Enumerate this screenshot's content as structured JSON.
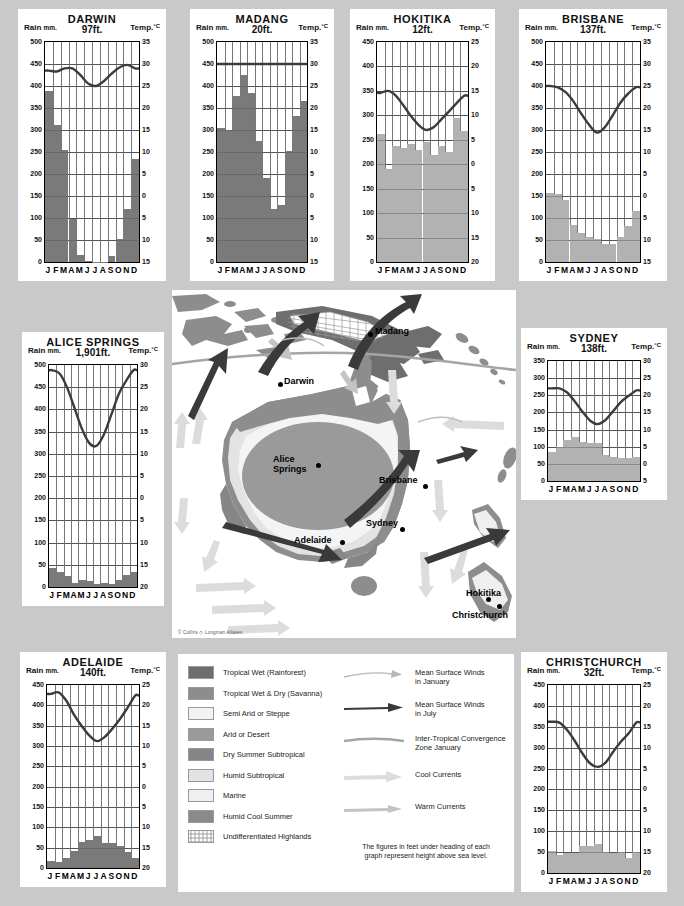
{
  "page": {
    "background_color": "#c9c9c9",
    "copyright": "© Collins ◇ Longman Atlases"
  },
  "labels": {
    "rain_axis": "Rain",
    "rain_unit": "mm.",
    "temp_axis": "Temp.",
    "temp_unit": "°C",
    "months": [
      "J",
      "F",
      "M",
      "A",
      "M",
      "J",
      "J",
      "A",
      "S",
      "O",
      "N",
      "D"
    ]
  },
  "colors": {
    "bar_dark": "#7a7a7a",
    "bar_light": "#b2b2b2",
    "temp_line": "#3c3c3c",
    "panel": "#ffffff",
    "grid": "#555555"
  },
  "chart_data": [
    {
      "type": "bar",
      "id": "darwin",
      "title": "DARWIN",
      "subtitle": "97ft.",
      "xlabel": "",
      "ylabel": "Rain mm.",
      "y2label": "Temp.°C",
      "categories": [
        "J",
        "F",
        "M",
        "A",
        "M",
        "J",
        "J",
        "A",
        "S",
        "O",
        "N",
        "D"
      ],
      "rain_ticks": [
        0,
        50,
        100,
        150,
        200,
        250,
        300,
        350,
        400,
        450,
        500
      ],
      "temp_ticks": [
        -15,
        -10,
        -5,
        0,
        5,
        10,
        15,
        20,
        25,
        30,
        35
      ],
      "ylim": [
        0,
        500
      ],
      "y2lim": [
        -15,
        35
      ],
      "bar_color": "#7a7a7a",
      "series": [
        {
          "name": "Rainfall (mm)",
          "type": "bar",
          "values": [
            388,
            312,
            255,
            97,
            17,
            3,
            1,
            1,
            13,
            53,
            120,
            235
          ]
        },
        {
          "name": "Temperature (°C)",
          "type": "line",
          "values": [
            28.5,
            28.3,
            29.0,
            29.0,
            27.5,
            25.6,
            25.0,
            26.1,
            27.8,
            29.2,
            29.8,
            29.0
          ]
        }
      ]
    },
    {
      "type": "bar",
      "id": "madang",
      "title": "MADANG",
      "subtitle": "20ft.",
      "xlabel": "",
      "ylabel": "Rain mm.",
      "y2label": "Temp.°C",
      "categories": [
        "J",
        "F",
        "M",
        "A",
        "M",
        "J",
        "J",
        "A",
        "S",
        "O",
        "N",
        "D"
      ],
      "rain_ticks": [
        0,
        50,
        100,
        150,
        200,
        250,
        300,
        350,
        400,
        450,
        500
      ],
      "temp_ticks": [
        -15,
        -10,
        -5,
        0,
        5,
        10,
        15,
        20,
        25,
        30,
        35
      ],
      "ylim": [
        0,
        500
      ],
      "y2lim": [
        -15,
        35
      ],
      "bar_color": "#7a7a7a",
      "series": [
        {
          "name": "Rainfall (mm)",
          "type": "bar",
          "values": [
            305,
            300,
            378,
            425,
            385,
            275,
            192,
            120,
            130,
            253,
            332,
            367
          ]
        },
        {
          "name": "Temperature (°C)",
          "type": "line",
          "values": [
            30,
            30,
            30,
            30,
            30,
            30,
            30,
            30,
            30,
            30,
            30,
            30
          ]
        }
      ]
    },
    {
      "type": "bar",
      "id": "hokitika",
      "title": "HOKITIKA",
      "subtitle": "12ft.",
      "xlabel": "",
      "ylabel": "Rain mm.",
      "y2label": "Temp.°C",
      "categories": [
        "J",
        "F",
        "M",
        "A",
        "M",
        "J",
        "J",
        "A",
        "S",
        "O",
        "N",
        "D"
      ],
      "rain_ticks": [
        0,
        50,
        100,
        150,
        200,
        250,
        300,
        350,
        400,
        450
      ],
      "temp_ticks": [
        -20,
        -15,
        -10,
        -5,
        0,
        5,
        10,
        15,
        20,
        25
      ],
      "ylim": [
        0,
        450
      ],
      "y2lim": [
        -20,
        25
      ],
      "bar_color": "#b2b2b2",
      "series": [
        {
          "name": "Rainfall (mm)",
          "type": "bar",
          "values": [
            261,
            190,
            238,
            234,
            241,
            229,
            246,
            218,
            238,
            225,
            295,
            268
          ]
        },
        {
          "name": "Temperature (°C)",
          "type": "line",
          "values": [
            14.6,
            15.0,
            14.0,
            12.0,
            9.8,
            8.0,
            7.0,
            7.6,
            9.2,
            10.8,
            12.5,
            14.0
          ]
        }
      ]
    },
    {
      "type": "bar",
      "id": "brisbane",
      "title": "BRISBANE",
      "subtitle": "137ft.",
      "xlabel": "",
      "ylabel": "Rain mm.",
      "y2label": "Temp.°C",
      "categories": [
        "J",
        "F",
        "M",
        "A",
        "M",
        "J",
        "J",
        "A",
        "S",
        "O",
        "N",
        "D"
      ],
      "rain_ticks": [
        0,
        50,
        100,
        150,
        200,
        250,
        300,
        350,
        400,
        450,
        500
      ],
      "temp_ticks": [
        -15,
        -10,
        -5,
        0,
        5,
        10,
        15,
        20,
        25,
        30,
        35
      ],
      "ylim": [
        0,
        500
      ],
      "y2lim": [
        -15,
        35
      ],
      "bar_color": "#b2b2b2",
      "series": [
        {
          "name": "Rainfall (mm)",
          "type": "bar",
          "values": [
            158,
            155,
            140,
            85,
            65,
            58,
            53,
            40,
            42,
            58,
            83,
            115
          ]
        },
        {
          "name": "Temperature (°C)",
          "type": "line",
          "values": [
            25.0,
            24.7,
            23.6,
            21.5,
            18.7,
            16.2,
            14.4,
            15.6,
            18.3,
            21.2,
            23.3,
            24.7
          ]
        }
      ]
    },
    {
      "type": "bar",
      "id": "alice-springs",
      "title": "ALICE SPRINGS",
      "subtitle": "1,901ft.",
      "xlabel": "",
      "ylabel": "Rain mm.",
      "y2label": "Temp.°C",
      "categories": [
        "J",
        "F",
        "M",
        "A",
        "M",
        "J",
        "J",
        "A",
        "S",
        "O",
        "N",
        "D"
      ],
      "rain_ticks": [
        0,
        50,
        100,
        150,
        200,
        250,
        300,
        350,
        400,
        450,
        500
      ],
      "temp_ticks": [
        -20,
        -15,
        -10,
        -5,
        0,
        5,
        10,
        15,
        20,
        25,
        30
      ],
      "ylim": [
        0,
        500
      ],
      "y2lim": [
        -20,
        30
      ],
      "bar_color": "#7a7a7a",
      "series": [
        {
          "name": "Rainfall (mm)",
          "type": "bar",
          "values": [
            43,
            33,
            25,
            10,
            15,
            13,
            7,
            8,
            7,
            15,
            28,
            35
          ]
        },
        {
          "name": "Temperature (°C)",
          "type": "line",
          "values": [
            28.8,
            28.0,
            24.8,
            20.2,
            15.6,
            12.4,
            11.8,
            14.4,
            18.8,
            23.4,
            26.4,
            28.8
          ]
        }
      ]
    },
    {
      "type": "bar",
      "id": "sydney",
      "title": "SYDNEY",
      "subtitle": "138ft.",
      "xlabel": "",
      "ylabel": "Rain mm.",
      "y2label": "Temp.°C",
      "categories": [
        "J",
        "F",
        "M",
        "A",
        "M",
        "J",
        "J",
        "A",
        "S",
        "O",
        "N",
        "D"
      ],
      "rain_ticks": [
        0,
        50,
        100,
        150,
        200,
        250,
        300,
        350
      ],
      "temp_ticks": [
        -5,
        0,
        5,
        10,
        15,
        20,
        25,
        30
      ],
      "ylim": [
        0,
        350
      ],
      "y2lim": [
        -5,
        30
      ],
      "bar_color": "#b2b2b2",
      "series": [
        {
          "name": "Rainfall (mm)",
          "type": "bar",
          "values": [
            85,
            100,
            120,
            128,
            115,
            112,
            112,
            75,
            70,
            68,
            68,
            70
          ]
        },
        {
          "name": "Temperature (°C)",
          "type": "line",
          "values": [
            22.0,
            22.0,
            20.8,
            18.2,
            15.2,
            12.6,
            11.6,
            12.8,
            15.4,
            18.0,
            19.8,
            21.4
          ]
        }
      ]
    },
    {
      "type": "bar",
      "id": "adelaide",
      "title": "ADELAIDE",
      "subtitle": "140ft.",
      "xlabel": "",
      "ylabel": "Rain mm.",
      "y2label": "Temp.°C",
      "categories": [
        "J",
        "F",
        "M",
        "A",
        "M",
        "J",
        "J",
        "A",
        "S",
        "O",
        "N",
        "D"
      ],
      "rain_ticks": [
        0,
        50,
        100,
        150,
        200,
        250,
        300,
        350,
        400,
        450
      ],
      "temp_ticks": [
        -20,
        -15,
        -10,
        -5,
        0,
        5,
        10,
        15,
        20,
        25
      ],
      "ylim": [
        0,
        450
      ],
      "y2lim": [
        -20,
        25
      ],
      "bar_color": "#7a7a7a",
      "series": [
        {
          "name": "Rainfall (mm)",
          "type": "bar",
          "values": [
            18,
            15,
            25,
            42,
            65,
            70,
            78,
            62,
            62,
            55,
            40,
            25
          ]
        },
        {
          "name": "Temperature (°C)",
          "type": "line",
          "values": [
            22.8,
            23.2,
            21.2,
            17.8,
            15.0,
            12.6,
            11.2,
            12.2,
            14.2,
            16.6,
            19.4,
            22.4
          ]
        }
      ]
    },
    {
      "type": "bar",
      "id": "christchurch",
      "title": "CHRISTCHURCH",
      "subtitle": "32ft.",
      "xlabel": "",
      "ylabel": "Rain mm.",
      "y2label": "Temp.°C",
      "categories": [
        "J",
        "F",
        "M",
        "A",
        "M",
        "J",
        "J",
        "A",
        "S",
        "O",
        "N",
        "D"
      ],
      "rain_ticks": [
        0,
        50,
        100,
        150,
        200,
        250,
        300,
        350,
        400,
        450
      ],
      "temp_ticks": [
        -20,
        -15,
        -10,
        -5,
        0,
        5,
        10,
        15,
        20,
        25
      ],
      "ylim": [
        0,
        450
      ],
      "y2lim": [
        -20,
        25
      ],
      "bar_color": "#b2b2b2",
      "series": [
        {
          "name": "Rainfall (mm)",
          "type": "bar",
          "values": [
            52,
            43,
            48,
            48,
            65,
            65,
            70,
            50,
            48,
            50,
            35,
            50
          ]
        },
        {
          "name": "Temperature (°C)",
          "type": "line",
          "values": [
            16.2,
            16.0,
            14.2,
            11.6,
            8.6,
            6.2,
            5.4,
            6.4,
            9.0,
            11.4,
            13.4,
            16.0
          ]
        }
      ]
    }
  ],
  "map": {
    "cities": [
      {
        "name": "Madang",
        "label_x": 375,
        "label_y": 326,
        "dot_x": 368,
        "dot_y": 332
      },
      {
        "name": "Darwin",
        "label_x": 284,
        "label_y": 376,
        "dot_x": 278,
        "dot_y": 382
      },
      {
        "name": "Alice Springs",
        "label_x": 273,
        "label_y": 454,
        "dot_x": 316,
        "dot_y": 463
      },
      {
        "name": "Brisbane",
        "label_x": 379,
        "label_y": 475,
        "dot_x": 423,
        "dot_y": 484
      },
      {
        "name": "Sydney",
        "label_x": 366,
        "label_y": 518,
        "dot_x": 400,
        "dot_y": 527
      },
      {
        "name": "Adelaide",
        "label_x": 294,
        "label_y": 535,
        "dot_x": 340,
        "dot_y": 540
      },
      {
        "name": "Hokitika",
        "label_x": 466,
        "label_y": 588,
        "dot_x": 486,
        "dot_y": 597
      },
      {
        "name": "Christchurch",
        "label_x": 452,
        "label_y": 610,
        "dot_x": 497,
        "dot_y": 604
      }
    ]
  },
  "legend": {
    "climate_zones": [
      {
        "label": "Tropical Wet (Rainforest)",
        "color": "#6e6e6e"
      },
      {
        "label": "Tropical Wet & Dry (Savanna)",
        "color": "#8d8d8d"
      },
      {
        "label": "Semi Arid or Steppe",
        "color": "#f2f2f2"
      },
      {
        "label": "Arid or Desert",
        "color": "#9a9a9a"
      },
      {
        "label": "Dry Summer Subtropical",
        "color": "#868686"
      },
      {
        "label": "Humid Subtropical",
        "color": "#e3e3e3"
      },
      {
        "label": "Marine",
        "color": "#efefef"
      },
      {
        "label": "Humid Cool Summer",
        "color": "#8a8a8a"
      },
      {
        "label": "Undifferentiated Highlands",
        "color": "#ffffff"
      }
    ],
    "symbols": [
      {
        "label_line1": "Mean Surface Winds",
        "label_line2": "in January",
        "icon": "thin-arrow-icon",
        "color": "#b8b8b8"
      },
      {
        "label_line1": "Mean Surface Winds",
        "label_line2": "in July",
        "icon": "bold-arrow-icon",
        "color": "#3a3a3a"
      },
      {
        "label_line1": "Inter-Tropical Convergence",
        "label_line2": "Zone January",
        "icon": "convergence-line-icon",
        "color": "#a5a5a5"
      },
      {
        "label_line1": "Cool Currents",
        "label_line2": "",
        "icon": "cool-current-arrow-icon",
        "color": "#dcdcdc"
      },
      {
        "label_line1": "Warm Currents",
        "label_line2": "",
        "icon": "warm-current-arrow-icon",
        "color": "#c4c4c4"
      }
    ],
    "footnote_line1": "The figures in feet under heading of each",
    "footnote_line2": "graph represent height above sea level."
  }
}
